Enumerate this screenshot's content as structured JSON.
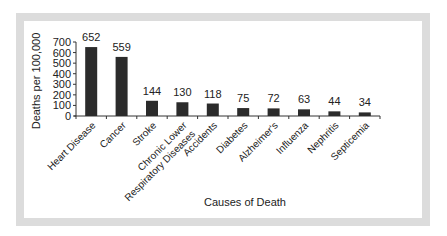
{
  "chart_data": {
    "type": "bar",
    "title": "",
    "xlabel": "Causes of Death",
    "ylabel": "Deaths per 100,000",
    "ylim": [
      0,
      700
    ],
    "yticks": [
      0,
      100,
      200,
      300,
      400,
      500,
      600,
      700
    ],
    "grid": false,
    "legend": null,
    "bar_color": "#2b2b2b",
    "categories": [
      "Heart Disease",
      "Cancer",
      "Stroke",
      "Chronic Lower Respiratory Diseases",
      "Accidents",
      "Diabetes",
      "Alzheimer's",
      "Influenza",
      "Nephritis",
      "Septicemia"
    ],
    "category_label_lines": [
      [
        "Heart Disease"
      ],
      [
        "Cancer"
      ],
      [
        "Stroke"
      ],
      [
        "Chronic Lower",
        "Respiratory Diseases"
      ],
      [
        "Accidents"
      ],
      [
        "Diabetes"
      ],
      [
        "Alzheimer's"
      ],
      [
        "Influenza"
      ],
      [
        "Nephritis"
      ],
      [
        "Septicemia"
      ]
    ],
    "values": [
      652,
      559,
      144,
      130,
      118,
      75,
      72,
      63,
      44,
      34
    ],
    "data_labels": [
      "652",
      "559",
      "144",
      "130",
      "118",
      "75",
      "72",
      "63",
      "44",
      "34"
    ]
  }
}
